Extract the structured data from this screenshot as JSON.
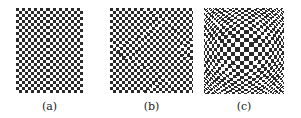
{
  "figure": {
    "panels": [
      {
        "id": "a",
        "caption": "(a)",
        "x": 16,
        "y": 8,
        "w": 67,
        "h": 85,
        "cell": 3.05,
        "distortion": "none",
        "strength": 0
      },
      {
        "id": "b",
        "caption": "(b)",
        "x": 110,
        "y": 8,
        "w": 83,
        "h": 85,
        "cell": 3.05,
        "distortion": "subtle",
        "strength": 0.06
      },
      {
        "id": "c",
        "caption": "(c)",
        "x": 204,
        "y": 8,
        "w": 80,
        "h": 86,
        "cell": 3.1,
        "distortion": "radial",
        "strength": 0.35
      }
    ],
    "captions_y": 100,
    "colors": {
      "dark": "#2a2a2a",
      "light": "#ffffff"
    }
  }
}
